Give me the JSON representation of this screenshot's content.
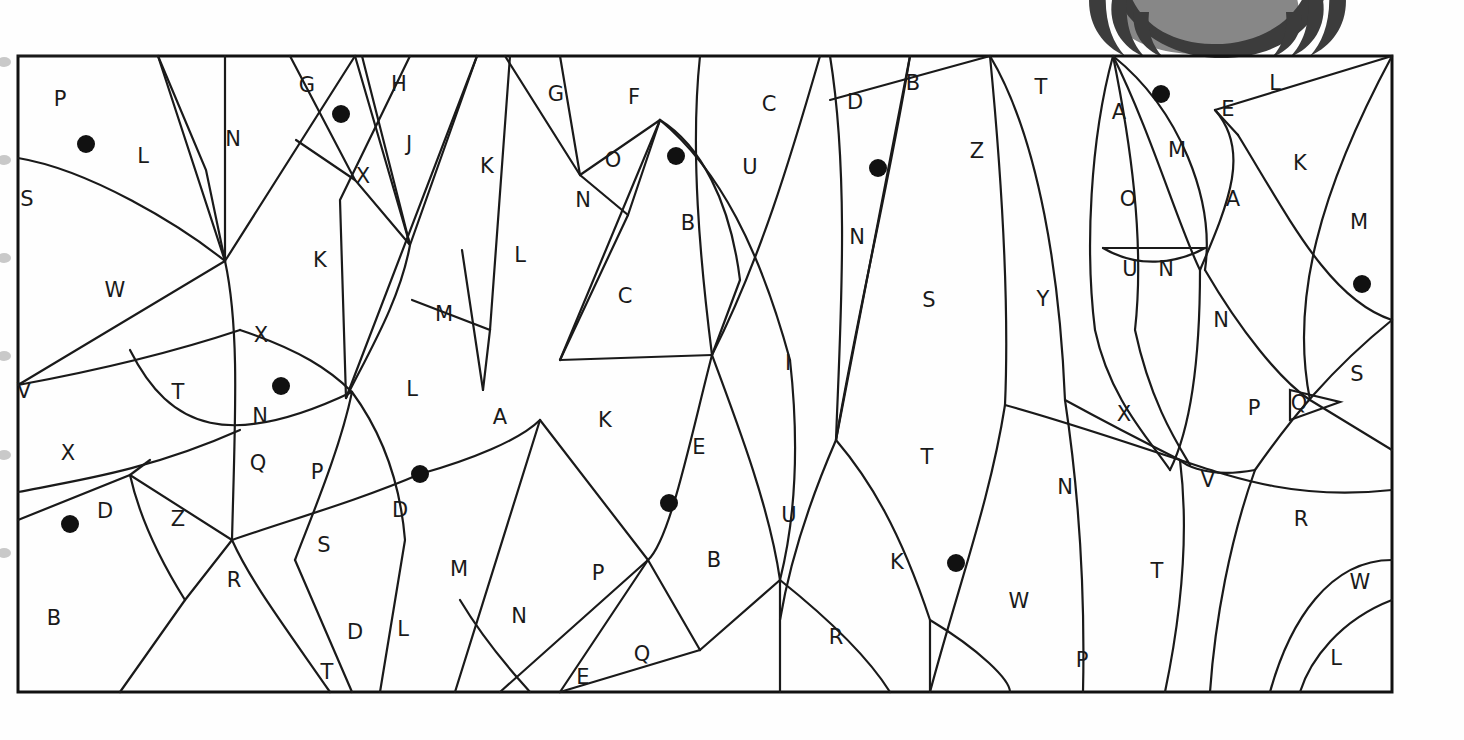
{
  "page": {
    "kind": "color-by-letter-puzzle",
    "width": 1464,
    "height": 740,
    "background_color": "#ffffff",
    "ink_color": "#1a1a1a",
    "frame": {
      "x": 18,
      "y": 56,
      "width": 1374,
      "height": 636
    }
  },
  "decoration": {
    "name": "claw-graphic-top-right",
    "description": "partially cropped dark claw/eye graphic above the frame",
    "colors": {
      "dark": "#3c3c3c",
      "mid": "#878787",
      "light": "#ffffff"
    },
    "bounds": {
      "x": 1080,
      "y": 0,
      "width": 290,
      "height": 58
    }
  },
  "binding_marks": {
    "name": "spiral-binding-marks-left-edge",
    "color": "#c9c9c9",
    "y_positions": [
      62,
      160,
      258,
      356,
      455,
      553
    ]
  },
  "legend": {
    "dot_meaning": "filled dot marks a region to be colored",
    "dot_color": "#111111",
    "dot_radius": 9
  },
  "letters": [
    {
      "char": "P",
      "x": 60,
      "y": 100
    },
    {
      "char": "L",
      "x": 143,
      "y": 157
    },
    {
      "char": "N",
      "x": 233,
      "y": 140
    },
    {
      "char": "G",
      "x": 307,
      "y": 86
    },
    {
      "char": "H",
      "x": 399,
      "y": 85
    },
    {
      "char": "J",
      "x": 409,
      "y": 145
    },
    {
      "char": "X",
      "x": 363,
      "y": 177
    },
    {
      "char": "K",
      "x": 487,
      "y": 167
    },
    {
      "char": "G",
      "x": 556,
      "y": 95
    },
    {
      "char": "F",
      "x": 634,
      "y": 98
    },
    {
      "char": "O",
      "x": 613,
      "y": 161
    },
    {
      "char": "N",
      "x": 583,
      "y": 201
    },
    {
      "char": "C",
      "x": 769,
      "y": 105
    },
    {
      "char": "U",
      "x": 750,
      "y": 168
    },
    {
      "char": "B",
      "x": 688,
      "y": 224
    },
    {
      "char": "D",
      "x": 855,
      "y": 103
    },
    {
      "char": "B",
      "x": 913,
      "y": 84
    },
    {
      "char": "Z",
      "x": 977,
      "y": 152
    },
    {
      "char": "N",
      "x": 857,
      "y": 238
    },
    {
      "char": "T",
      "x": 1041,
      "y": 88
    },
    {
      "char": "A",
      "x": 1119,
      "y": 113
    },
    {
      "char": "M",
      "x": 1177,
      "y": 151
    },
    {
      "char": "E",
      "x": 1228,
      "y": 110
    },
    {
      "char": "L",
      "x": 1275,
      "y": 84
    },
    {
      "char": "K",
      "x": 1300,
      "y": 164
    },
    {
      "char": "A",
      "x": 1233,
      "y": 200
    },
    {
      "char": "M",
      "x": 1359,
      "y": 223
    },
    {
      "char": "O",
      "x": 1128,
      "y": 200
    },
    {
      "char": "S",
      "x": 27,
      "y": 200
    },
    {
      "char": "W",
      "x": 115,
      "y": 291
    },
    {
      "char": "K",
      "x": 320,
      "y": 261
    },
    {
      "char": "L",
      "x": 520,
      "y": 256
    },
    {
      "char": "M",
      "x": 444,
      "y": 315
    },
    {
      "char": "C",
      "x": 625,
      "y": 297
    },
    {
      "char": "S",
      "x": 929,
      "y": 301
    },
    {
      "char": "Y",
      "x": 1043,
      "y": 300
    },
    {
      "char": "U",
      "x": 1130,
      "y": 270
    },
    {
      "char": "N",
      "x": 1166,
      "y": 270
    },
    {
      "char": "N",
      "x": 1221,
      "y": 321
    },
    {
      "char": "X",
      "x": 261,
      "y": 336
    },
    {
      "char": "V",
      "x": 24,
      "y": 392
    },
    {
      "char": "T",
      "x": 178,
      "y": 393
    },
    {
      "char": "N",
      "x": 260,
      "y": 417
    },
    {
      "char": "L",
      "x": 412,
      "y": 390
    },
    {
      "char": "A",
      "x": 500,
      "y": 418
    },
    {
      "char": "K",
      "x": 605,
      "y": 421
    },
    {
      "char": "I",
      "x": 788,
      "y": 364
    },
    {
      "char": "E",
      "x": 699,
      "y": 448
    },
    {
      "char": "S",
      "x": 1357,
      "y": 375
    },
    {
      "char": "P",
      "x": 1254,
      "y": 409
    },
    {
      "char": "Q",
      "x": 1299,
      "y": 404
    },
    {
      "char": "X",
      "x": 1124,
      "y": 415
    },
    {
      "char": "X",
      "x": 68,
      "y": 454
    },
    {
      "char": "Q",
      "x": 258,
      "y": 464
    },
    {
      "char": "P",
      "x": 317,
      "y": 473
    },
    {
      "char": "D",
      "x": 400,
      "y": 511
    },
    {
      "char": "D",
      "x": 105,
      "y": 512
    },
    {
      "char": "Z",
      "x": 178,
      "y": 520
    },
    {
      "char": "T",
      "x": 927,
      "y": 458
    },
    {
      "char": "N",
      "x": 1065,
      "y": 488
    },
    {
      "char": "V",
      "x": 1208,
      "y": 481
    },
    {
      "char": "U",
      "x": 789,
      "y": 516
    },
    {
      "char": "B",
      "x": 714,
      "y": 561
    },
    {
      "char": "S",
      "x": 324,
      "y": 546
    },
    {
      "char": "M",
      "x": 459,
      "y": 570
    },
    {
      "char": "P",
      "x": 598,
      "y": 574
    },
    {
      "char": "K",
      "x": 897,
      "y": 563
    },
    {
      "char": "W",
      "x": 1019,
      "y": 602
    },
    {
      "char": "T",
      "x": 1157,
      "y": 572
    },
    {
      "char": "R",
      "x": 1301,
      "y": 520
    },
    {
      "char": "W",
      "x": 1360,
      "y": 583
    },
    {
      "char": "B",
      "x": 54,
      "y": 619
    },
    {
      "char": "R",
      "x": 234,
      "y": 581
    },
    {
      "char": "D",
      "x": 355,
      "y": 633
    },
    {
      "char": "L",
      "x": 403,
      "y": 630
    },
    {
      "char": "N",
      "x": 519,
      "y": 617
    },
    {
      "char": "T",
      "x": 327,
      "y": 673
    },
    {
      "char": "E",
      "x": 583,
      "y": 678
    },
    {
      "char": "Q",
      "x": 642,
      "y": 655
    },
    {
      "char": "R",
      "x": 836,
      "y": 638
    },
    {
      "char": "P",
      "x": 1082,
      "y": 661
    },
    {
      "char": "L",
      "x": 1336,
      "y": 659
    }
  ],
  "dots": [
    {
      "x": 86,
      "y": 144
    },
    {
      "x": 341,
      "y": 114
    },
    {
      "x": 676,
      "y": 156
    },
    {
      "x": 878,
      "y": 168
    },
    {
      "x": 1161,
      "y": 94
    },
    {
      "x": 1362,
      "y": 284
    },
    {
      "x": 281,
      "y": 386
    },
    {
      "x": 420,
      "y": 474
    },
    {
      "x": 669,
      "y": 503
    },
    {
      "x": 70,
      "y": 524
    },
    {
      "x": 956,
      "y": 563
    }
  ],
  "paths": [
    "M 18 56 L 158 56 L 225 261 L 18 385",
    "M 18 158 C 90 170 180 225 225 261",
    "M 158 56 L 206 170 L 225 261",
    "M 225 56 L 225 261",
    "M 225 261 C 240 330 235 420 232 540",
    "M 225 261 L 355 56",
    "M 290 56 L 355 180 L 410 245",
    "M 355 56 L 410 245",
    "M 362 56 L 410 245",
    "M 355 180 L 296 140",
    "M 410 56 L 340 200 L 346 398",
    "M 410 245 C 400 300 370 350 346 398",
    "M 477 56 L 410 245",
    "M 477 56 L 346 398",
    "M 412 300 L 490 330 L 483 390",
    "M 462 250 L 483 390",
    "M 510 56 L 490 330",
    "M 560 56 L 580 175",
    "M 580 175 L 505 56",
    "M 580 175 L 660 120",
    "M 580 175 L 628 215",
    "M 628 215 L 660 120",
    "M 628 215 L 560 360",
    "M 660 120 L 560 360",
    "M 660 120 C 700 145 730 200 740 280",
    "M 660 120 C 720 170 760 250 790 360",
    "M 700 56 C 690 150 700 260 712 355",
    "M 712 355 L 560 360",
    "M 740 280 L 712 355",
    "M 712 355 C 690 440 670 540 648 560",
    "M 790 360 C 800 450 795 520 780 580",
    "M 712 355 C 740 430 770 510 780 580",
    "M 820 56 C 790 160 760 260 712 355",
    "M 830 56 C 850 180 840 330 836 440",
    "M 910 56 C 890 180 860 300 836 440",
    "M 910 56 L 836 440",
    "M 830 100 L 990 56",
    "M 836 440 C 870 480 900 530 930 620",
    "M 836 440 C 810 500 790 560 780 620",
    "M 990 56 C 1000 160 1010 290 1005 405",
    "M 1005 405 C 990 500 960 580 930 692",
    "M 990 56 C 1040 140 1060 280 1065 400",
    "M 1065 400 C 1080 500 1085 600 1083 692",
    "M 1113 56 C 1090 140 1085 250 1095 330",
    "M 1113 56 C 1130 140 1145 240 1135 330",
    "M 1113 56 C 1150 130 1180 230 1200 270",
    "M 1113 56 C 1180 110 1215 200 1205 270",
    "M 1095 330 C 1110 400 1150 440 1170 470",
    "M 1135 330 C 1150 400 1175 440 1190 465",
    "M 1200 270 C 1200 360 1190 430 1170 470",
    "M 1103 248 L 1205 248",
    "M 1103 248 C 1140 270 1180 262 1205 248",
    "M 1200 270 C 1230 200 1250 150 1215 110",
    "M 1215 110 L 1238 135",
    "M 1215 110 L 1392 56",
    "M 1238 135 C 1290 220 1330 300 1392 320",
    "M 1205 270 C 1240 330 1280 380 1310 400",
    "M 1310 400 L 1392 450",
    "M 1310 400 C 1290 300 1320 190 1392 56",
    "M 1290 390 L 1340 402 L 1290 420 Z",
    "M 1392 320 C 1330 370 1290 420 1255 470",
    "M 1255 470 C 1230 540 1215 620 1210 692",
    "M 1392 560 C 1330 560 1290 620 1270 692",
    "M 1392 600 C 1340 620 1310 660 1300 692",
    "M 18 385 C 100 370 180 350 240 330",
    "M 240 330 C 300 350 330 370 352 392",
    "M 130 350 C 170 430 230 450 352 392",
    "M 18 492 C 80 480 150 470 240 430",
    "M 18 520 L 130 475 L 232 540",
    "M 130 475 L 150 460",
    "M 130 475 C 140 520 160 560 185 600",
    "M 232 540 L 185 600 L 120 692",
    "M 232 540 C 250 580 280 620 330 692",
    "M 232 540 C 290 520 360 500 420 474",
    "M 352 392 C 340 450 310 520 295 560",
    "M 295 560 L 352 692",
    "M 352 392 C 380 430 400 480 405 540",
    "M 405 540 L 380 692",
    "M 420 474 C 470 460 520 440 540 420",
    "M 540 420 L 455 692",
    "M 540 420 L 648 560",
    "M 648 560 L 560 692",
    "M 460 600 C 490 650 520 680 530 692",
    "M 648 560 L 500 692",
    "M 560 692 L 700 650",
    "M 700 650 L 648 560",
    "M 780 580 L 700 650",
    "M 780 580 L 780 692",
    "M 780 580 C 830 620 870 660 890 692",
    "M 930 620 L 930 692",
    "M 930 620 C 980 650 1010 680 1010 692",
    "M 1005 405 C 1060 420 1120 440 1180 460",
    "M 1180 460 C 1240 480 1300 500 1392 490",
    "M 1065 400 C 1120 430 1180 460 1180 460",
    "M 1180 460 C 1190 540 1180 620 1165 692",
    "M 1255 470 C 1200 480 1180 460 1180 460"
  ]
}
